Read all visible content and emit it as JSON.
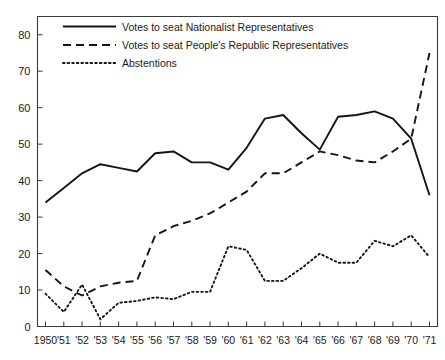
{
  "chart_data": {
    "type": "line",
    "title": "",
    "subtitle": "",
    "xlabel": "",
    "ylabel": "",
    "xlim": [
      0,
      21
    ],
    "ylim": [
      0,
      85
    ],
    "yticks": [
      0,
      10,
      20,
      30,
      40,
      50,
      60,
      70,
      80
    ],
    "ytick_labels": [
      "0",
      "10",
      "20",
      "30",
      "40",
      "50",
      "60",
      "70",
      "80"
    ],
    "grid": false,
    "legend_position": "top-left",
    "categories": [
      "1950",
      "'51",
      "'52",
      "'53",
      "'54",
      "'55",
      "'56",
      "'57",
      "'58",
      "'59",
      "'60",
      "'61",
      "'62",
      "'63",
      "'64",
      "'65",
      "'66",
      "'67",
      "'68",
      "'69",
      "'70",
      "'71"
    ],
    "x": [
      1950,
      1951,
      1952,
      1953,
      1954,
      1955,
      1956,
      1957,
      1958,
      1959,
      1960,
      1961,
      1962,
      1963,
      1964,
      1965,
      1966,
      1967,
      1968,
      1969,
      1970,
      1971
    ],
    "series": [
      {
        "name": "Votes to seat Nationalist Representatives",
        "style": "solid",
        "color": "#141414",
        "values": [
          34,
          38,
          42,
          44.5,
          43.5,
          42.5,
          47.5,
          48,
          45,
          45,
          43,
          49,
          57,
          58,
          53,
          48.5,
          57.5,
          58,
          59,
          57,
          51.5,
          36
        ]
      },
      {
        "name": "Votes to seat People's Republic Representatives",
        "style": "dashed",
        "color": "#141414",
        "values": [
          15.5,
          11,
          8.5,
          11,
          12,
          12.5,
          25,
          27.5,
          29,
          31,
          34,
          37,
          42,
          42,
          45,
          48,
          47,
          45.5,
          45,
          48,
          51.5,
          75
        ]
      },
      {
        "name": "Abstentions",
        "style": "dotted",
        "color": "#141414",
        "values": [
          9,
          4,
          11.5,
          2,
          6.5,
          7,
          8,
          7.5,
          9.5,
          9.5,
          22,
          21,
          12.5,
          12.5,
          16,
          20,
          17.5,
          17.5,
          23.5,
          22,
          25,
          19
        ]
      }
    ],
    "legend": [
      {
        "label": "Votes to seat Nationalist Representatives",
        "style": "solid"
      },
      {
        "label": "Votes to seat People's Republic Representatives",
        "style": "dashed"
      },
      {
        "label": "Abstentions",
        "style": "dotted"
      }
    ]
  }
}
